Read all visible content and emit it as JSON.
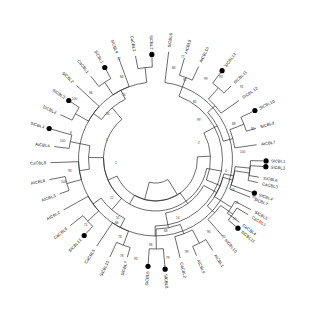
{
  "figure": {
    "type": "radial-cladogram",
    "background_color": "#ffffff",
    "line_color": "#2b2b2b",
    "marker_color": "#000000",
    "marker_meaning": "filled-circle-marked-taxon"
  },
  "chart_data": {
    "type": "tree",
    "layout": "circular",
    "title": "",
    "taxa_count": 40,
    "marked_count": 13,
    "species_prefixes": [
      "SlCBL",
      "CaCBL",
      "AtCBL"
    ],
    "taxa": [
      {
        "id": 0,
        "label": "SlCBL3",
        "angle": 94,
        "marked": true
      },
      {
        "id": 1,
        "label": "CaCBL3",
        "angle": 103,
        "marked": false
      },
      {
        "id": 2,
        "label": "SlCBL7",
        "angle": 112,
        "marked": false
      },
      {
        "id": 3,
        "label": "CaCBL1",
        "angle": 121,
        "marked": false
      },
      {
        "id": 4,
        "label": "SlCBL11",
        "angle": 130,
        "marked": true
      },
      {
        "id": 5,
        "label": "SlCBL10",
        "angle": 139,
        "marked": false
      },
      {
        "id": 6,
        "label": "AtCBL1",
        "angle": 148,
        "marked": false
      },
      {
        "id": 7,
        "label": "AtCBL9",
        "angle": 157,
        "marked": false
      },
      {
        "id": 8,
        "label": "CaCBL2",
        "angle": 166,
        "marked": false
      },
      {
        "id": 9,
        "label": "SlCBL8",
        "angle": 175,
        "marked": true
      },
      {
        "id": 10,
        "label": "SlCBL5",
        "angle": 184,
        "marked": true
      },
      {
        "id": 11,
        "label": "SlCBL7",
        "angle": 196,
        "marked": false
      },
      {
        "id": 12,
        "label": "SlCBL13",
        "angle": 205,
        "marked": false
      },
      {
        "id": 13,
        "label": "CaCBL5",
        "angle": 214,
        "marked": false
      },
      {
        "id": 14,
        "label": "SlCBL12",
        "angle": 223,
        "marked": true
      },
      {
        "id": 15,
        "label": "CaCBL6",
        "angle": 232,
        "marked": false
      },
      {
        "id": 16,
        "label": "AtCBL2",
        "angle": 241,
        "marked": false
      },
      {
        "id": 17,
        "label": "AtCBL3",
        "angle": 250,
        "marked": false
      },
      {
        "id": 18,
        "label": "AtCBL8",
        "angle": 259,
        "marked": false
      },
      {
        "id": 19,
        "label": "CaCBL8",
        "angle": 268,
        "marked": false
      },
      {
        "id": 20,
        "label": "AtCBL4",
        "angle": 277,
        "marked": false
      },
      {
        "id": 21,
        "label": "SlCBL4",
        "angle": 286,
        "marked": true
      },
      {
        "id": 22,
        "label": "SlCBL2",
        "angle": 295,
        "marked": false
      },
      {
        "id": 23,
        "label": "SlCBL3",
        "angle": 304,
        "marked": true
      },
      {
        "id": 24,
        "label": "SlCBL2",
        "angle": 313,
        "marked": false
      },
      {
        "id": 25,
        "label": "CaCBL1",
        "angle": 322,
        "marked": false
      },
      {
        "id": 26,
        "label": "SlCBL1",
        "angle": 331,
        "marked": true
      },
      {
        "id": 27,
        "label": "SlCBL4",
        "angle": 340,
        "marked": false
      },
      {
        "id": 28,
        "label": "CaCBL2",
        "angle": 349,
        "marked": false
      },
      {
        "id": 29,
        "label": "SlCBL2",
        "angle": 358,
        "marked": true
      },
      {
        "id": 30,
        "label": "SlCBL6",
        "angle": 7,
        "marked": false
      },
      {
        "id": 31,
        "label": "AtCBL5",
        "angle": 16,
        "marked": false
      },
      {
        "id": 32,
        "label": "AtCBL10",
        "angle": 25,
        "marked": false
      },
      {
        "id": 33,
        "label": "SlCBL13",
        "angle": 37,
        "marked": true
      },
      {
        "id": 34,
        "label": "SlCBL11",
        "angle": 46,
        "marked": false
      },
      {
        "id": 35,
        "label": "SlCBL 12",
        "angle": 55,
        "marked": false
      },
      {
        "id": 36,
        "label": "SlCBL10",
        "angle": 64,
        "marked": true
      },
      {
        "id": 37,
        "label": "SlCBL9",
        "angle": 73,
        "marked": false
      },
      {
        "id": 38,
        "label": "AtCBL7",
        "angle": 82,
        "marked": false
      },
      {
        "id": 39,
        "label": "SlCBL1",
        "angle": 91,
        "marked": true
      },
      {
        "id": 40,
        "label": "SlCBL6",
        "angle": 100,
        "marked": false
      },
      {
        "id": 41,
        "label": "SlCBL4",
        "angle": 109,
        "marked": true
      },
      {
        "id": 42,
        "label": "SlCBL5",
        "angle": 118,
        "marked": false
      },
      {
        "id": 43,
        "label": "CaCBL4",
        "angle": 127,
        "marked": false
      }
    ],
    "bootstrap_values": [
      {
        "value": "77",
        "x": 181,
        "y": 58
      },
      {
        "value": "86",
        "x": 172,
        "y": 69
      },
      {
        "value": "92",
        "x": 183,
        "y": 81
      },
      {
        "value": "99",
        "x": 204,
        "y": 80
      },
      {
        "value": "93",
        "x": 219,
        "y": 78
      },
      {
        "value": "91",
        "x": 240,
        "y": 88
      },
      {
        "value": "85",
        "x": 193,
        "y": 103
      },
      {
        "value": "88",
        "x": 232,
        "y": 125
      },
      {
        "value": "92",
        "x": 251,
        "y": 130
      },
      {
        "value": "99",
        "x": 197,
        "y": 121
      },
      {
        "value": "2",
        "x": 198,
        "y": 144
      },
      {
        "value": "100",
        "x": 240,
        "y": 153
      },
      {
        "value": "4",
        "x": 225,
        "y": 172
      },
      {
        "value": "13",
        "x": 231,
        "y": 191
      },
      {
        "value": "98",
        "x": 252,
        "y": 198
      },
      {
        "value": "25",
        "x": 235,
        "y": 204
      },
      {
        "value": "15",
        "x": 233,
        "y": 220
      },
      {
        "value": "14",
        "x": 176,
        "y": 219
      },
      {
        "value": "68",
        "x": 164,
        "y": 232
      },
      {
        "value": "96",
        "x": 207,
        "y": 233
      },
      {
        "value": "95",
        "x": 222,
        "y": 238
      },
      {
        "value": "99",
        "x": 185,
        "y": 253
      },
      {
        "value": "96",
        "x": 149,
        "y": 246
      },
      {
        "value": "93",
        "x": 134,
        "y": 260
      },
      {
        "value": "79",
        "x": 166,
        "y": 259
      },
      {
        "value": "1",
        "x": 106,
        "y": 141
      },
      {
        "value": "1",
        "x": 115,
        "y": 164
      },
      {
        "value": "12",
        "x": 110,
        "y": 199
      },
      {
        "value": "55",
        "x": 116,
        "y": 219
      },
      {
        "value": "86",
        "x": 115,
        "y": 224
      },
      {
        "value": "71",
        "x": 84,
        "y": 226
      },
      {
        "value": "78",
        "x": 118,
        "y": 238
      },
      {
        "value": "78",
        "x": 120,
        "y": 257
      },
      {
        "value": "93",
        "x": 68,
        "y": 172
      },
      {
        "value": "100",
        "x": 61,
        "y": 183
      },
      {
        "value": "8",
        "x": 70,
        "y": 134
      },
      {
        "value": "100",
        "x": 60,
        "y": 142
      },
      {
        "value": "94",
        "x": 106,
        "y": 115
      },
      {
        "value": "100",
        "x": 72,
        "y": 100
      },
      {
        "value": "96",
        "x": 89,
        "y": 94
      },
      {
        "value": "74",
        "x": 122,
        "y": 96
      },
      {
        "value": "86",
        "x": 120,
        "y": 78
      },
      {
        "value": "72",
        "x": 117,
        "y": 60
      }
    ]
  },
  "accessibility": {
    "alt": "Circular phylogenetic tree showing 40 CBL gene family members from tomato (SlCBL), pepper (CaCBL) and Arabidopsis (AtCBL), with bootstrap support values at nodes and filled circles marking selected taxa."
  }
}
